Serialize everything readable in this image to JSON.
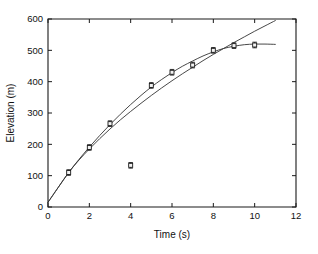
{
  "chart_data": {
    "type": "scatter",
    "title": "",
    "subtitle": "",
    "xlabel": "Time (s)",
    "ylabel": "Elevation (m)",
    "xlim": [
      0,
      12
    ],
    "ylim": [
      0,
      600
    ],
    "xticks": [
      0,
      2,
      4,
      6,
      8,
      10,
      12
    ],
    "yticks": [
      0,
      100,
      200,
      300,
      400,
      500,
      600
    ],
    "xtick_labels": [
      "0",
      "2",
      "4",
      "6",
      "8",
      "10",
      "12"
    ],
    "ytick_labels": [
      "0",
      "100",
      "200",
      "300",
      "400",
      "500",
      "600"
    ],
    "grid": false,
    "legend": null,
    "legend_position": "none",
    "box": true,
    "tick_direction": "in",
    "series": [
      {
        "name": "Measured elevation",
        "type": "scatter",
        "marker": "square-with-errorbars",
        "x": [
          1,
          2,
          3,
          4,
          5,
          6,
          7,
          8,
          9,
          10
        ],
        "y": [
          110,
          190,
          266,
          133,
          388,
          430,
          453,
          500,
          515,
          517
        ],
        "yerr": [
          9,
          9,
          9,
          9,
          9,
          9,
          9,
          9,
          9,
          9
        ]
      },
      {
        "name": "Saturating fit",
        "type": "line",
        "x": [
          0,
          0.5,
          1,
          1.5,
          2,
          2.5,
          3,
          3.5,
          4,
          4.5,
          5,
          5.5,
          6,
          6.5,
          7,
          7.5,
          8,
          8.5,
          9,
          9.5,
          10,
          10.5,
          11
        ],
        "y": [
          15,
          63,
          110,
          152,
          191,
          228,
          263,
          296,
          327,
          356,
          383,
          407,
          429,
          449,
          466,
          482,
          495,
          506,
          513,
          518,
          520,
          520,
          519
        ]
      },
      {
        "name": "Power-law fit",
        "type": "line",
        "x": [
          0,
          0.5,
          1,
          1.5,
          2,
          2.5,
          3,
          3.5,
          4,
          4.5,
          5,
          5.5,
          6,
          6.5,
          7,
          7.5,
          8,
          8.5,
          9,
          9.5,
          10,
          10.5,
          11
        ],
        "y": [
          15,
          63,
          110,
          150,
          185,
          218,
          249,
          278,
          305,
          331,
          356,
          380,
          403,
          425,
          446,
          467,
          487,
          506,
          525,
          543,
          561,
          578,
          595
        ]
      }
    ],
    "annotations": [
      {
        "label": "outlier",
        "x": 4,
        "y": 133
      }
    ]
  },
  "axes": {
    "x_title": "Time (s)",
    "y_title": "Elevation (m)"
  }
}
